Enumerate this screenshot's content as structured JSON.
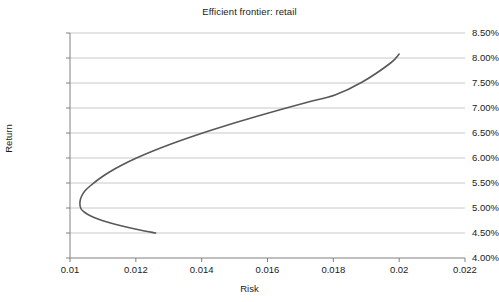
{
  "chart_data": {
    "type": "line",
    "title": "Efficient frontier: retail",
    "xlabel": "Risk",
    "ylabel": "Return",
    "xlim": [
      0.01,
      0.022
    ],
    "ylim": [
      0.04,
      0.085
    ],
    "grid": true,
    "legend": false,
    "line_color": "#595959",
    "grid_color": "#c8c8c8",
    "axis_color": "#808080",
    "xticks": [
      0.01,
      0.012,
      0.014,
      0.016,
      0.018,
      0.02,
      0.022
    ],
    "xtick_labels": [
      "0.01",
      "0.012",
      "0.014",
      "0.016",
      "0.018",
      "0.02",
      "0.022"
    ],
    "yticks": [
      0.04,
      0.045,
      0.05,
      0.055,
      0.06,
      0.065,
      0.07,
      0.075,
      0.08,
      0.085
    ],
    "ytick_labels": [
      "4.00%",
      "4.50%",
      "5.00%",
      "5.50%",
      "6.00%",
      "6.50%",
      "7.00%",
      "7.50%",
      "8.00%",
      "8.50%"
    ],
    "series": [
      {
        "name": "Efficient frontier",
        "x": [
          0.0126,
          0.01205,
          0.01158,
          0.01118,
          0.01085,
          0.0106,
          0.01043,
          0.01033,
          0.0103,
          0.01034,
          0.01045,
          0.01063,
          0.01088,
          0.0112,
          0.01158,
          0.01202,
          0.01252,
          0.01307,
          0.01367,
          0.01431,
          0.01499,
          0.01571,
          0.01646,
          0.01724,
          0.01805,
          0.01888,
          0.01974,
          0.02
        ],
        "y": [
          0.045,
          0.0457,
          0.0464,
          0.0471,
          0.0478,
          0.0485,
          0.0492,
          0.0499,
          0.051,
          0.0522,
          0.0534,
          0.0545,
          0.0558,
          0.0572,
          0.0586,
          0.06,
          0.0614,
          0.0628,
          0.0642,
          0.0656,
          0.067,
          0.0684,
          0.0698,
          0.0712,
          0.0726,
          0.0752,
          0.079,
          0.0808
        ]
      }
    ],
    "annotations": {
      "min_variance_point": {
        "x": 0.0103,
        "y": 0.0545
      },
      "upper_endpoint": {
        "x": 0.02,
        "y": 0.0808
      },
      "lower_endpoint": {
        "x": 0.0126,
        "y": 0.045
      }
    }
  }
}
